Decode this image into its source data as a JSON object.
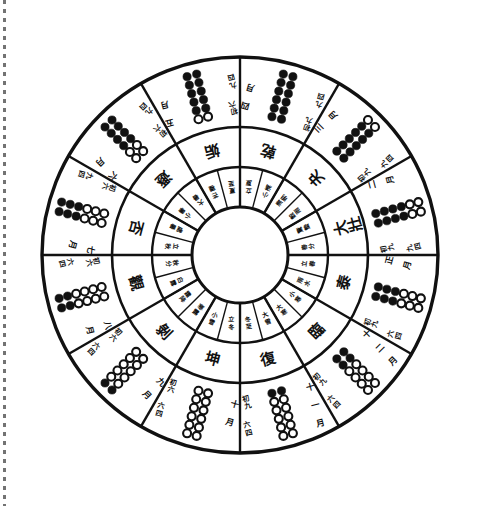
{
  "figure": {
    "type": "twelve-sovereign-hexagram-calendar-wheel",
    "title": "",
    "center_label": "",
    "background_color": "#ffffff",
    "ink_color": "#111111",
    "yang_marker": "filled-dot",
    "yin_marker": "open-circle",
    "rings": {
      "outer_label": "hexagram lines, line names and lunar months",
      "middle_label": "hexagram names",
      "inner_label": "twenty-four solar terms"
    },
    "margin_rule": "dashed-page-edge"
  },
  "chart_data": {
    "type": "pie",
    "title": "",
    "categories": [
      "復",
      "臨",
      "泰",
      "大壯",
      "夬",
      "乾",
      "姤",
      "遯",
      "否",
      "觀",
      "剝",
      "坤"
    ],
    "values": [
      1,
      1,
      1,
      1,
      1,
      1,
      1,
      1,
      1,
      1,
      1,
      1
    ],
    "legend": "none",
    "grid": false
  },
  "sectors": [
    {
      "index": 0,
      "hexagram": "復",
      "month": "十一月",
      "lines": [
        "yang",
        "yin",
        "yin",
        "yin",
        "yin",
        "yin"
      ],
      "yang_count": 1,
      "line_labels": [
        "初九",
        "六二",
        "六三",
        "六四",
        "六五",
        "上六"
      ],
      "terms": [
        "大雪",
        "冬至"
      ]
    },
    {
      "index": 1,
      "hexagram": "臨",
      "month": "十二月",
      "lines": [
        "yang",
        "yang",
        "yin",
        "yin",
        "yin",
        "yin"
      ],
      "yang_count": 2,
      "line_labels": [
        "初九",
        "九二",
        "六三",
        "六四",
        "六五",
        "上六"
      ],
      "terms": [
        "小寒",
        "大寒"
      ]
    },
    {
      "index": 2,
      "hexagram": "泰",
      "month": "正月",
      "lines": [
        "yang",
        "yang",
        "yang",
        "yin",
        "yin",
        "yin"
      ],
      "yang_count": 3,
      "line_labels": [
        "初九",
        "九二",
        "九三",
        "六四",
        "六五",
        "上六"
      ],
      "terms": [
        "立春",
        "雨水"
      ]
    },
    {
      "index": 3,
      "hexagram": "大壯",
      "month": "二月",
      "lines": [
        "yang",
        "yang",
        "yang",
        "yang",
        "yin",
        "yin"
      ],
      "yang_count": 4,
      "line_labels": [
        "初九",
        "九二",
        "九三",
        "九四",
        "六五",
        "上六"
      ],
      "terms": [
        "驚蟄",
        "春分"
      ]
    },
    {
      "index": 4,
      "hexagram": "夬",
      "month": "三月",
      "lines": [
        "yang",
        "yang",
        "yang",
        "yang",
        "yang",
        "yin"
      ],
      "yang_count": 5,
      "line_labels": [
        "初九",
        "九二",
        "九三",
        "九四",
        "九五",
        "上六"
      ],
      "terms": [
        "清明",
        "穀雨"
      ]
    },
    {
      "index": 5,
      "hexagram": "乾",
      "month": "四月",
      "lines": [
        "yang",
        "yang",
        "yang",
        "yang",
        "yang",
        "yang"
      ],
      "yang_count": 6,
      "line_labels": [
        "初九",
        "九二",
        "九三",
        "九四",
        "九五",
        "上九"
      ],
      "terms": [
        "立夏",
        "小滿"
      ]
    },
    {
      "index": 6,
      "hexagram": "姤",
      "month": "五月",
      "lines": [
        "yin",
        "yang",
        "yang",
        "yang",
        "yang",
        "yang"
      ],
      "yang_count": 5,
      "line_labels": [
        "初六",
        "九二",
        "九三",
        "九四",
        "九五",
        "上九"
      ],
      "terms": [
        "芒種",
        "夏至"
      ]
    },
    {
      "index": 7,
      "hexagram": "遯",
      "month": "六月",
      "lines": [
        "yin",
        "yin",
        "yang",
        "yang",
        "yang",
        "yang"
      ],
      "yang_count": 4,
      "line_labels": [
        "初六",
        "六二",
        "九三",
        "九四",
        "九五",
        "上九"
      ],
      "terms": [
        "小暑",
        "大暑"
      ]
    },
    {
      "index": 8,
      "hexagram": "否",
      "month": "七月",
      "lines": [
        "yin",
        "yin",
        "yin",
        "yang",
        "yang",
        "yang"
      ],
      "yang_count": 3,
      "line_labels": [
        "初六",
        "六二",
        "六三",
        "九四",
        "九五",
        "上九"
      ],
      "terms": [
        "立秋",
        "處暑"
      ]
    },
    {
      "index": 9,
      "hexagram": "觀",
      "month": "八月",
      "lines": [
        "yin",
        "yin",
        "yin",
        "yin",
        "yang",
        "yang"
      ],
      "yang_count": 2,
      "line_labels": [
        "初六",
        "六二",
        "六三",
        "六四",
        "九五",
        "上九"
      ],
      "terms": [
        "白露",
        "秋分"
      ]
    },
    {
      "index": 10,
      "hexagram": "剝",
      "month": "九月",
      "lines": [
        "yin",
        "yin",
        "yin",
        "yin",
        "yin",
        "yang"
      ],
      "yang_count": 1,
      "line_labels": [
        "初六",
        "六二",
        "六三",
        "六四",
        "六五",
        "上九"
      ],
      "terms": [
        "寒露",
        "霜降"
      ]
    },
    {
      "index": 11,
      "hexagram": "坤",
      "month": "十月",
      "lines": [
        "yin",
        "yin",
        "yin",
        "yin",
        "yin",
        "yin"
      ],
      "yang_count": 0,
      "line_labels": [
        "初六",
        "六二",
        "六三",
        "六四",
        "六五",
        "上六"
      ],
      "terms": [
        "立冬",
        "小雪"
      ]
    }
  ]
}
